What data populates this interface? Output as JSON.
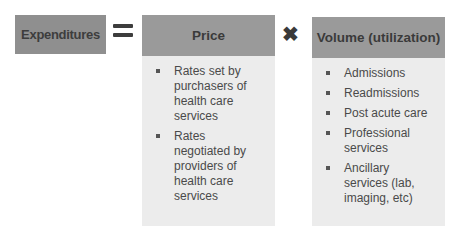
{
  "equation": {
    "left_term": "Expenditures",
    "equals_icon": "equals-icon",
    "times_icon": "multiply-icon"
  },
  "price": {
    "title": "Price",
    "items": [
      "Rates set by purchasers of health care services",
      "Rates negotiated by providers of health care services"
    ]
  },
  "volume": {
    "title": "Volume (utilization)",
    "items": [
      "Admissions",
      "Readmissions",
      "Post acute care",
      "Professional services",
      "Ancillary services (lab, imaging, etc)"
    ]
  },
  "colors": {
    "header_bg": "#9a9a9a",
    "body_bg": "#ececec",
    "left_box_bg": "#8f8f8f",
    "text": "#4a4a4a"
  }
}
